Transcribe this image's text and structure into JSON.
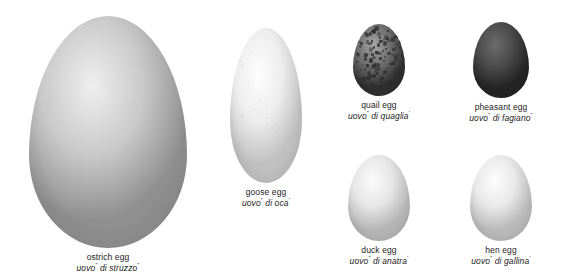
{
  "figure": {
    "background_color": "#ffffff",
    "text_color": "#1c1c1c",
    "superscript_mark": "”"
  },
  "specimens": [
    {
      "key": "ostrich",
      "name_en": "ostrich egg",
      "name_it_pre": "uovo",
      "name_it_post": " di struzzo",
      "sup1": "”",
      "sup2": "”",
      "color_base": "#c9c9c9",
      "color_light": "#efefef",
      "color_dark": "#8f8f8f",
      "speckled": false
    },
    {
      "key": "goose",
      "name_en": "goose egg",
      "name_it_pre": "uovo",
      "name_it_post": " di oca",
      "sup1": "”",
      "sup2": "’",
      "color_base": "#ededed",
      "color_light": "#fdfdfd",
      "color_dark": "#c0c0c0",
      "speckled": true
    },
    {
      "key": "quail",
      "name_en": "quail egg",
      "name_it_pre": "uovo",
      "name_it_post": " di quaglia",
      "sup1": "”",
      "sup2": "’",
      "color_base": "#6e6e6e",
      "color_light": "#a8a8a8",
      "color_dark": "#2e2e2e",
      "speckled": true
    },
    {
      "key": "pheasant",
      "name_en": "pheasant egg",
      "name_it_pre": "uovo",
      "name_it_post": " di fagiano",
      "sup1": "”",
      "sup2": "”",
      "color_base": "#4a4a4a",
      "color_light": "#6d6d6d",
      "color_dark": "#232323",
      "speckled": false
    },
    {
      "key": "duck",
      "name_en": "duck egg",
      "name_it_pre": "uovo",
      "name_it_post": " di anatra",
      "sup1": "”",
      "sup2": "’",
      "color_base": "#e6e6e6",
      "color_light": "#fbfbfb",
      "color_dark": "#b4b4b4",
      "speckled": false
    },
    {
      "key": "hen",
      "name_en": "hen egg",
      "name_it_pre": "uovo",
      "name_it_post": " di gallina",
      "sup1": "”",
      "sup2": "’",
      "color_base": "#e9e9e9",
      "color_light": "#fdfdfd",
      "color_dark": "#b8b8b8",
      "speckled": false
    }
  ]
}
